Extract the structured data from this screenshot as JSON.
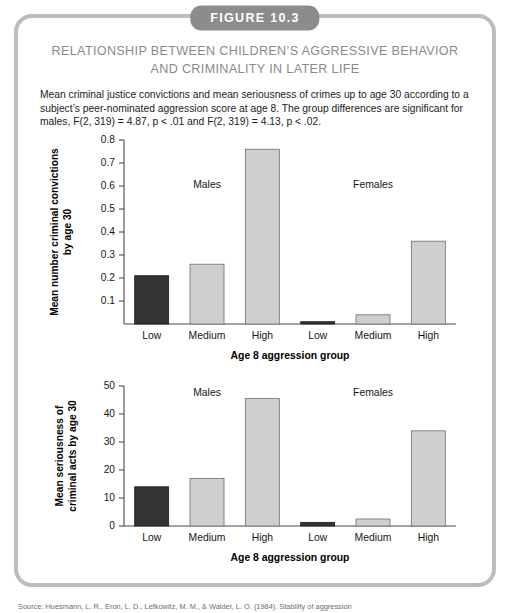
{
  "figure": {
    "badge": "FIGURE 10.3",
    "title_line1": "RELATIONSHIP BETWEEN CHILDREN’S AGGRESSIVE BEHAVIOR",
    "title_line2": "AND CRIMINALITY IN LATER LIFE",
    "caption": "Mean criminal justice convictions and mean seriousness of crimes up to age 30 according to a subject’s peer-nominated aggression score at age 8. The group differences are significant for males, F(2, 319) = 4.87, p < .01 and F(2, 319) = 4.13, p < .02.",
    "source": "Source: Huesmann, L. R., Eron, L. D., Lefkowitz, M. M., & Walder, L. O. (1984). Stability of aggression"
  },
  "colors": {
    "frame": "#bcbcbc",
    "badge_bg": "#8c8c8c",
    "title": "#8a8a8a",
    "bar_dark": "#333333",
    "bar_light": "#cfcfcf",
    "bar_stroke": "#6e6e6e",
    "axis": "#4a4a4a"
  },
  "chart_data": [
    {
      "type": "bar",
      "title": "",
      "xlabel": "Age 8 aggression group",
      "ylabel": "Mean number criminal convictions by age 30",
      "ylabel_line1": "Mean number criminal convictions",
      "ylabel_line2": "by age 30",
      "ylim": [
        0,
        0.8
      ],
      "yticks": [
        "0.1",
        "0.2",
        "0.3",
        "0.4",
        "0.5",
        "0.6",
        "0.7",
        "0.8"
      ],
      "ytick_values": [
        0.1,
        0.2,
        0.3,
        0.4,
        0.5,
        0.6,
        0.7,
        0.8
      ],
      "grid": false,
      "legend": "none",
      "group_labels": [
        "Males",
        "Females"
      ],
      "categories": [
        "Low",
        "Medium",
        "High",
        "Low",
        "Medium",
        "High"
      ],
      "values": [
        0.21,
        0.26,
        0.76,
        0.01,
        0.04,
        0.36
      ],
      "bar_styles": [
        "dark",
        "light",
        "light",
        "dark",
        "light",
        "light"
      ]
    },
    {
      "type": "bar",
      "title": "",
      "xlabel": "Age 8 aggression group",
      "ylabel": "Mean seriousness of criminal acts by age 30",
      "ylabel_line1": "Mean seriousness of",
      "ylabel_line2": "criminal acts by age 30",
      "ylim": [
        0,
        50
      ],
      "yticks": [
        "0",
        "10",
        "20",
        "30",
        "40",
        "50"
      ],
      "ytick_values": [
        0,
        10,
        20,
        30,
        40,
        50
      ],
      "grid": false,
      "legend": "none",
      "group_labels": [
        "Males",
        "Females"
      ],
      "categories": [
        "Low",
        "Medium",
        "High",
        "Low",
        "Medium",
        "High"
      ],
      "values": [
        14,
        17,
        45.5,
        1.3,
        2.5,
        34
      ],
      "bar_styles": [
        "dark",
        "light",
        "light",
        "dark",
        "light",
        "light"
      ]
    }
  ]
}
